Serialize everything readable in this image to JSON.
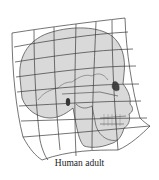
{
  "diagram": {
    "caption": "Human adult",
    "colors": {
      "background": "#ffffff",
      "skull_fill": "#d9d9d9",
      "grid_stroke": "#3a3a3a",
      "outline_stroke": "#555555",
      "caption_text": "#222222"
    }
  }
}
